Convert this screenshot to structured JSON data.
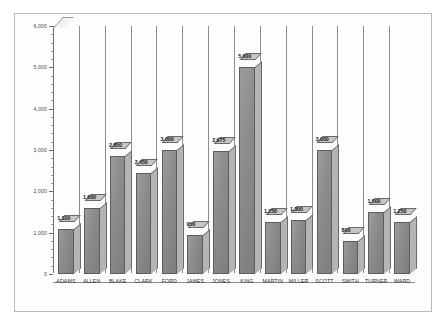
{
  "chart_data": {
    "type": "bar",
    "title": "",
    "subtitle": "",
    "xlabel": "",
    "ylabel": "",
    "orientation": "vertical",
    "style": "3d-column",
    "grid": "vertical-category-dividers",
    "legend": "none",
    "ylim": [
      0,
      6000
    ],
    "ytick_step": 1000,
    "yticks": [
      0,
      1000,
      2000,
      3000,
      4000,
      5000,
      6000
    ],
    "ytick_labels": [
      "0",
      "1,000",
      "2,000",
      "3,000",
      "4,000",
      "5,000",
      "6,000"
    ],
    "minor_ticks_per_interval": 4,
    "categories": [
      "ADAMS",
      "ALLEN",
      "BLAKE",
      "CLARK",
      "FORD",
      "JAMES",
      "JONES",
      "KING",
      "MARTIN",
      "MILLER",
      "SCOTT",
      "SMITH",
      "TURNER",
      "WARD"
    ],
    "values": [
      1100,
      1600,
      2850,
      2450,
      3000,
      950,
      2975,
      5000,
      1250,
      1300,
      3000,
      800,
      1500,
      1250
    ],
    "value_labels": [
      "1,100",
      "1,600",
      "2,850",
      "2,450",
      "3,000",
      "950",
      "2,975",
      "5,000",
      "1,250",
      "1,300",
      "3,000",
      "800",
      "1,500",
      "1,250"
    ],
    "series": [
      {
        "name": "",
        "values": [
          1100,
          1600,
          2850,
          2450,
          3000,
          950,
          2975,
          5000,
          1250,
          1300,
          3000,
          800,
          1500,
          1250
        ]
      }
    ],
    "colors": {
      "bar_front": "#8c8c8c",
      "bar_side": "#b4b4b4",
      "bar_top": "#c6c6c6",
      "bar_outline": "#5d5d5d",
      "gridline": "#8c8c8c",
      "axis": "#6e6e6e",
      "background": "#fdfdfd",
      "frame_border": "#b9b9b9",
      "value_label": "#111111",
      "tick_label": "#4a4a4a"
    }
  }
}
